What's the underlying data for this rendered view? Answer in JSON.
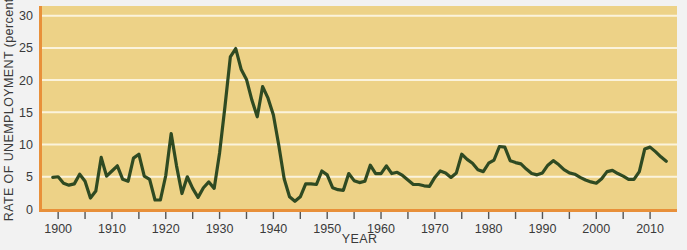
{
  "figure": {
    "background_color": "#f2f2f2",
    "plot_background_color": "#edd287",
    "plot_border_color": "#e8903a",
    "gridline_color": "#fbf3dc",
    "line_color": "#2f4a22",
    "axis_text_color": "#3a3a3a"
  },
  "chart_data": {
    "type": "line",
    "title": "",
    "xlabel": "YEAR",
    "ylabel": "RATE OF UNEMPLOYMENT (percent)",
    "xlim": [
      1897,
      2015
    ],
    "ylim": [
      0,
      31.5
    ],
    "grid": true,
    "grid_axis": "y",
    "legend": "none",
    "series_name": "Rate of unemployment (percent)",
    "y_ticks": [
      0,
      5,
      10,
      15,
      20,
      25,
      30
    ],
    "y_tick_labels": [
      "0",
      "5",
      "10",
      "15",
      "20",
      "25",
      "30"
    ],
    "x_ticks_major": [
      1900,
      1910,
      1920,
      1930,
      1940,
      1950,
      1960,
      1970,
      1980,
      1990,
      2000,
      2010
    ],
    "x_tick_labels": [
      "1900",
      "1910",
      "1920",
      "1930",
      "1940",
      "1950",
      "1960",
      "1970",
      "1980",
      "1990",
      "2000",
      "2010"
    ],
    "x_ticks_minor": [
      1905,
      1915,
      1925,
      1935,
      1945,
      1955,
      1965,
      1975,
      1985,
      1995,
      2005
    ],
    "x": [
      1899,
      1900,
      1901,
      1902,
      1903,
      1904,
      1905,
      1906,
      1907,
      1908,
      1909,
      1910,
      1911,
      1912,
      1913,
      1914,
      1915,
      1916,
      1917,
      1918,
      1919,
      1920,
      1921,
      1922,
      1923,
      1924,
      1925,
      1926,
      1927,
      1928,
      1929,
      1930,
      1931,
      1932,
      1933,
      1934,
      1935,
      1936,
      1937,
      1938,
      1939,
      1940,
      1941,
      1942,
      1943,
      1944,
      1945,
      1946,
      1947,
      1948,
      1949,
      1950,
      1951,
      1952,
      1953,
      1954,
      1955,
      1956,
      1957,
      1958,
      1959,
      1960,
      1961,
      1962,
      1963,
      1964,
      1965,
      1966,
      1967,
      1968,
      1969,
      1970,
      1971,
      1972,
      1973,
      1974,
      1975,
      1976,
      1977,
      1978,
      1979,
      1980,
      1981,
      1982,
      1983,
      1984,
      1985,
      1986,
      1987,
      1988,
      1989,
      1990,
      1991,
      1992,
      1993,
      1994,
      1995,
      1996,
      1997,
      1998,
      1999,
      2000,
      2001,
      2002,
      2003,
      2004,
      2005,
      2006,
      2007,
      2008,
      2009,
      2010,
      2011,
      2012,
      2013
    ],
    "y": [
      4.9,
      5.0,
      4.0,
      3.7,
      3.9,
      5.4,
      4.3,
      1.7,
      2.8,
      8.0,
      5.1,
      5.9,
      6.7,
      4.6,
      4.3,
      7.9,
      8.5,
      5.1,
      4.6,
      1.4,
      1.4,
      5.2,
      11.7,
      6.7,
      2.4,
      5.0,
      3.2,
      1.8,
      3.3,
      4.2,
      3.2,
      8.7,
      15.9,
      23.6,
      24.9,
      21.7,
      20.1,
      16.9,
      14.3,
      19.0,
      17.2,
      14.6,
      9.9,
      4.7,
      1.9,
      1.2,
      1.9,
      3.9,
      3.9,
      3.8,
      5.9,
      5.3,
      3.3,
      3.0,
      2.9,
      5.5,
      4.4,
      4.1,
      4.3,
      6.8,
      5.5,
      5.5,
      6.7,
      5.5,
      5.7,
      5.2,
      4.5,
      3.8,
      3.8,
      3.6,
      3.5,
      4.9,
      5.9,
      5.6,
      4.9,
      5.6,
      8.5,
      7.7,
      7.1,
      6.1,
      5.8,
      7.1,
      7.6,
      9.7,
      9.6,
      7.5,
      7.2,
      7.0,
      6.2,
      5.5,
      5.3,
      5.6,
      6.8,
      7.5,
      6.9,
      6.1,
      5.6,
      5.4,
      4.9,
      4.5,
      4.2,
      4.0,
      4.7,
      5.8,
      6.0,
      5.5,
      5.1,
      4.6,
      4.6,
      5.8,
      9.3,
      9.6,
      8.9,
      8.1,
      7.4
    ]
  },
  "axis": {
    "xlabel": "YEAR",
    "ylabel": "RATE OF UNEMPLOYMENT (percent)"
  }
}
